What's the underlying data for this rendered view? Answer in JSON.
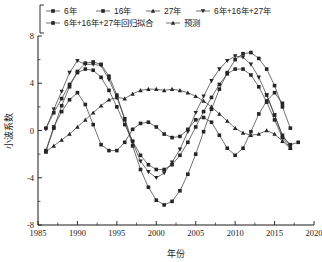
{
  "chart_data": {
    "type": "line",
    "title": "",
    "xlabel": "年份",
    "ylabel": "小波系数",
    "xlim": [
      1985,
      2020
    ],
    "ylim": [
      -8,
      8
    ],
    "xticks": [
      1985,
      1990,
      1995,
      2000,
      2005,
      2010,
      2015,
      2020
    ],
    "xtick_labels": [
      "1985",
      "1990",
      "1995",
      "2000",
      "2005",
      "2010",
      "2015",
      "2020"
    ],
    "yticks": [
      -8,
      -4,
      0,
      4,
      8
    ],
    "ytick_labels": [
      "-8",
      "-4",
      "0",
      "4",
      "8"
    ],
    "yticks_minor": [
      -6,
      -2,
      2,
      6
    ],
    "grid": false,
    "legend_position": "top",
    "series": [
      {
        "name": "6年",
        "marker": "square",
        "x": [
          1986,
          1987,
          1988,
          1989,
          1990,
          1991,
          1992,
          1993,
          1994,
          1995,
          1996,
          1997,
          1998,
          1999,
          2000,
          2001,
          2002,
          2003,
          2004,
          2005,
          2006,
          2007,
          2008,
          2009,
          2010,
          2011,
          2012,
          2013,
          2014,
          2015,
          2016
        ],
        "values": [
          -1.7,
          0.3,
          1.6,
          2.6,
          3.2,
          2.2,
          0.5,
          -1.2,
          -1.7,
          -1.7,
          -1.0,
          0.1,
          0.6,
          0.7,
          0.3,
          -0.3,
          -0.6,
          -0.5,
          0.1,
          0.9,
          1.1,
          0.7,
          -0.4,
          -1.5,
          -2.1,
          -1.5,
          -0.1,
          1.4,
          2.5,
          3.2,
          2.3
        ],
        "color": "#262626"
      },
      {
        "name": "16年",
        "marker": "square",
        "x": [
          1986,
          1987,
          1988,
          1989,
          1990,
          1991,
          1992,
          1993,
          1994,
          1995,
          1996,
          1997,
          1998,
          1999,
          2000,
          2001,
          2002,
          2003,
          2004,
          2005,
          2006,
          2007,
          2008,
          2009,
          2010,
          2011,
          2012,
          2013,
          2014,
          2015,
          2016,
          2017
        ],
        "values": [
          0.2,
          1.5,
          2.7,
          3.9,
          4.9,
          5.2,
          5.1,
          4.5,
          3.4,
          2.0,
          0.5,
          -0.9,
          -2.1,
          -2.9,
          -3.3,
          -3.3,
          -2.9,
          -2.1,
          -1.0,
          0.3,
          1.6,
          2.8,
          3.9,
          4.8,
          5.2,
          5.2,
          4.7,
          3.7,
          2.4,
          0.9,
          -0.6,
          -1.5
        ],
        "color": "#262626"
      },
      {
        "name": "27年",
        "marker": "triangle",
        "x": [
          1986,
          1987,
          1988,
          1989,
          1990,
          1991,
          1992,
          1993,
          1994,
          1995,
          1996,
          1997,
          1998,
          1999,
          2000,
          2001,
          2002,
          2003,
          2004,
          2005,
          2006,
          2007,
          2008,
          2009,
          2010,
          2011,
          2012,
          2013,
          2014,
          2015,
          2016,
          2017
        ],
        "values": [
          -1.8,
          -1.3,
          -0.8,
          -0.3,
          0.3,
          0.9,
          1.5,
          2.1,
          2.6,
          2.8,
          2.7,
          3.1,
          3.4,
          3.5,
          3.5,
          3.4,
          3.5,
          3.4,
          3.2,
          2.9,
          2.5,
          2.0,
          1.4,
          0.8,
          0.2,
          -0.2,
          -0.4,
          -0.3,
          0.0,
          -0.3,
          -0.9,
          -1.5
        ],
        "color": "#262626"
      },
      {
        "name": "6年+16年+27年",
        "marker": "triangle-down",
        "x": [
          1986,
          1987,
          1988,
          1989,
          1990,
          1991,
          1992,
          1993,
          1994,
          1995,
          1996,
          1997,
          1998,
          1999,
          2000,
          2001,
          2002,
          2003,
          2004,
          2005,
          2006,
          2007,
          2008,
          2009,
          2010,
          2011,
          2012,
          2013,
          2014,
          2015,
          2016,
          2017
        ],
        "values": [
          0.1,
          1.8,
          3.3,
          4.9,
          5.9,
          5.6,
          5.6,
          5.5,
          4.3,
          2.8,
          1.0,
          -1.0,
          -2.6,
          -3.5,
          -4.0,
          -3.6,
          -2.7,
          -1.6,
          -0.1,
          1.5,
          2.9,
          4.2,
          5.2,
          5.9,
          6.3,
          6.2,
          5.6,
          4.5,
          3.0,
          1.3,
          -0.4,
          -1.3
        ],
        "color": "#262626"
      },
      {
        "name": "6年+16年+27年回归拟合",
        "marker": "square",
        "x": [
          1986,
          1987,
          1988,
          1989,
          1990,
          1991,
          1992,
          1993,
          1994,
          1995,
          1996,
          1997,
          1998,
          1999,
          2000,
          2001,
          2002,
          2003,
          2004,
          2005,
          2006,
          2007,
          2008,
          2009,
          2010,
          2011,
          2012,
          2013,
          2014,
          2015,
          2016,
          2017
        ],
        "values": [
          -1.8,
          0.2,
          2.1,
          3.7,
          5.0,
          5.7,
          5.8,
          5.6,
          4.6,
          3.0,
          0.9,
          -1.3,
          -3.3,
          -4.8,
          -5.9,
          -6.3,
          -6.0,
          -5.1,
          -3.7,
          -2.0,
          -0.1,
          1.8,
          3.5,
          4.9,
          6.0,
          6.5,
          6.6,
          6.1,
          5.2,
          3.8,
          2.0,
          0.2
        ],
        "color": "#262626"
      },
      {
        "name": "预测",
        "marker": "square",
        "x": [
          2014,
          2015,
          2016,
          2017,
          2018
        ],
        "values": [
          3.0,
          1.3,
          -0.5,
          -1.2,
          -1.0
        ],
        "color": "#4a4a4a"
      }
    ]
  },
  "legend": {
    "rows": [
      [
        "6年",
        "16年",
        "27年",
        "6年+16年+27年"
      ],
      [
        "6年+16年+27年回归拟合",
        "预测"
      ]
    ]
  },
  "axes": {
    "x_title": "年份",
    "y_title": "小波系数"
  }
}
